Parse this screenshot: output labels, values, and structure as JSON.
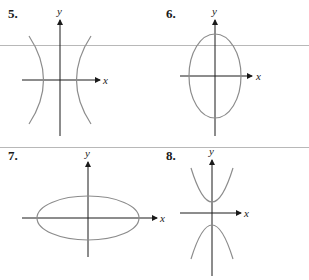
{
  "problems": [
    {
      "number": "5.",
      "shape": "hyperbola-horizontal",
      "x_label": "x",
      "y_label": "y"
    },
    {
      "number": "6.",
      "shape": "ellipse-vertical",
      "x_label": "x",
      "y_label": "y"
    },
    {
      "number": "7.",
      "shape": "ellipse-horizontal",
      "x_label": "x",
      "y_label": "y"
    },
    {
      "number": "8.",
      "shape": "hyperbola-vertical",
      "x_label": "x",
      "y_label": "y"
    }
  ],
  "colors": {
    "axis": "#1a1a1a",
    "curve": "#8c8c8c",
    "separator": "#b8b8b8"
  }
}
